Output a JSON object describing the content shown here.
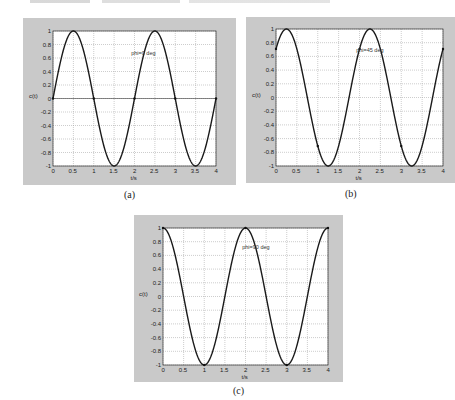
{
  "chart_data": [
    {
      "id": "a",
      "type": "line",
      "caption": "(a)",
      "annotation": "phi=0 deg",
      "phase_deg": 0,
      "xlabel": "t/s",
      "ylabel": "c(t)",
      "xlim": [
        0,
        4
      ],
      "ylim": [
        -1,
        1
      ],
      "xticks": [
        "0",
        "0.5",
        "1",
        "1.5",
        "2",
        "2.5",
        "3",
        "3.5",
        "4"
      ],
      "yticks": [
        "1",
        "0.8",
        "0.6",
        "0.4",
        "0.2",
        "0",
        "-0.2",
        "-0.4",
        "-0.6",
        "-0.8",
        "-1"
      ],
      "grid": true,
      "series": [
        {
          "name": "sin(pi*t + 0)",
          "x": [
            0,
            0.5,
            1,
            1.5,
            2,
            2.5,
            3,
            3.5,
            4
          ],
          "y": [
            0,
            1,
            0,
            -1,
            0,
            1,
            0,
            -1,
            0
          ]
        }
      ]
    },
    {
      "id": "b",
      "type": "line",
      "caption": "(b)",
      "annotation": "phi=45 deg",
      "phase_deg": 45,
      "xlabel": "t/s",
      "ylabel": "c(t)",
      "xlim": [
        0,
        4
      ],
      "ylim": [
        -1,
        1
      ],
      "xticks": [
        "0",
        "0.5",
        "1",
        "1.5",
        "2",
        "2.5",
        "3",
        "3.5",
        "4"
      ],
      "yticks": [
        "1",
        "0.8",
        "0.6",
        "0.4",
        "0.2",
        "0",
        "-0.2",
        "-0.4",
        "-0.6",
        "-0.8",
        "-1"
      ],
      "grid": true,
      "series": [
        {
          "name": "sin(pi*t + pi/4)",
          "x": [
            0,
            0.25,
            0.5,
            1,
            1.25,
            1.5,
            2,
            2.25,
            3,
            3.25,
            4
          ],
          "y": [
            0.707,
            1,
            0.707,
            -0.707,
            -1,
            -0.707,
            0.707,
            1,
            -0.707,
            -1,
            0.707
          ]
        }
      ]
    },
    {
      "id": "c",
      "type": "line",
      "caption": "(c)",
      "annotation": "phi=90 deg",
      "phase_deg": 90,
      "xlabel": "t/s",
      "ylabel": "c(t)",
      "xlim": [
        0,
        4
      ],
      "ylim": [
        -1,
        1
      ],
      "xticks": [
        "0",
        "0.5",
        "1",
        "1.5",
        "2",
        "2.5",
        "3",
        "3.5",
        "4"
      ],
      "yticks": [
        "1",
        "0.8",
        "0.6",
        "0.4",
        "0.2",
        "0",
        "-0.2",
        "-0.4",
        "-0.6",
        "-0.8",
        "-1"
      ],
      "grid": true,
      "series": [
        {
          "name": "sin(pi*t + pi/2)",
          "x": [
            0,
            0.5,
            1,
            1.5,
            2,
            2.5,
            3,
            3.5,
            4
          ],
          "y": [
            1,
            0,
            -1,
            0,
            1,
            0,
            -1,
            0,
            1
          ]
        }
      ]
    }
  ],
  "style": {
    "panel_color": "#c9c9c9",
    "axes_color": "#ffffff",
    "line_color": "#1a1a1a",
    "grid_color": "#9a9a9a"
  }
}
